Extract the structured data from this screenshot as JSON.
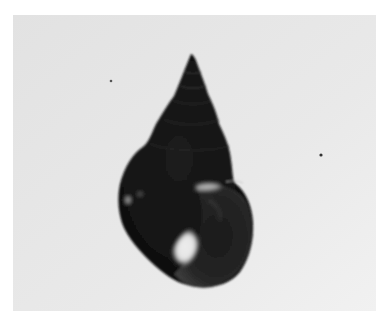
{
  "image": {
    "subject": "snail shell",
    "description": "Black-and-white photograph of a dark, glossy, high-spired freshwater snail shell on a light grey background",
    "colors": {
      "page_background": "#ffffff",
      "photo_background": "#e6e6e6",
      "photo_background_light": "#efefef",
      "shell_dark": "#141414",
      "shell_mid": "#2a2a2a",
      "shell_highlight": "#e8e8e8"
    }
  }
}
